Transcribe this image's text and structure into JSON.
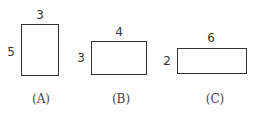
{
  "figures": [
    {
      "label": "(A)",
      "width_label": "3",
      "height_label": "5"
    },
    {
      "label": "(B)",
      "width_label": "4",
      "height_label": "3"
    },
    {
      "label": "(C)",
      "width_label": "6",
      "height_label": "2"
    }
  ]
}
